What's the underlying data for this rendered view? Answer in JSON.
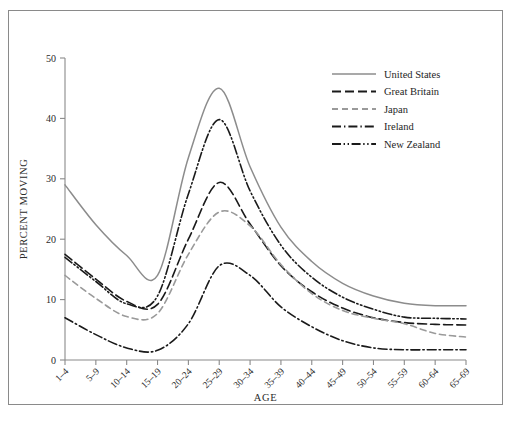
{
  "chart_data": {
    "type": "line",
    "title": "",
    "subtitle": "",
    "xlabel": "AGE",
    "ylabel": "PERCENT MOVING",
    "categories": [
      "1–4",
      "5–9",
      "10–14",
      "15–19",
      "20–24",
      "25–29",
      "30–34",
      "35–39",
      "40–44",
      "45–49",
      "50–54",
      "55–59",
      "60–64",
      "65–69"
    ],
    "xtick_labels": [
      "1–4",
      "5–9",
      "10–14",
      "15–19",
      "20–24",
      "25–29",
      "30–34",
      "35–39",
      "40–44",
      "45–49",
      "50–54",
      "55–59",
      "60–64",
      "65–69"
    ],
    "ytick_labels": [
      "0",
      "10",
      "20",
      "30",
      "40",
      "50"
    ],
    "ytick_values": [
      0,
      10,
      20,
      30,
      40,
      50
    ],
    "ylim": [
      0,
      50
    ],
    "grid": false,
    "legend_position": "top-right",
    "series": [
      {
        "name": "United States",
        "color": "#8c8c8c",
        "dash": "none",
        "values": [
          29.0,
          22.4,
          17.3,
          14.0,
          33.5,
          45.0,
          32.0,
          22.0,
          16.3,
          12.7,
          10.6,
          9.4,
          9.0,
          9.0
        ]
      },
      {
        "name": "Great Britain",
        "color": "#1a1a1a",
        "dash": "long-dash",
        "values": [
          17.5,
          13.4,
          9.7,
          9.2,
          20.0,
          29.4,
          22.5,
          15.6,
          11.3,
          8.6,
          7.0,
          6.2,
          5.9,
          5.8
        ]
      },
      {
        "name": "Japan",
        "color": "#9a9a9a",
        "dash": "dash",
        "values": [
          14.0,
          10.2,
          7.2,
          7.7,
          17.5,
          24.5,
          22.2,
          15.8,
          11.0,
          8.2,
          6.9,
          6.0,
          4.4,
          3.8
        ]
      },
      {
        "name": "Ireland",
        "color": "#1a1a1a",
        "dash": "dash-dot",
        "values": [
          7.0,
          4.2,
          2.0,
          1.6,
          6.0,
          15.6,
          14.0,
          8.8,
          5.5,
          3.2,
          2.0,
          1.7,
          1.7,
          1.7
        ]
      },
      {
        "name": "New Zealand",
        "color": "#1a1a1a",
        "dash": "dash-dot-dot",
        "values": [
          17.0,
          13.0,
          9.3,
          10.6,
          27.5,
          39.8,
          28.0,
          19.0,
          13.7,
          10.4,
          8.4,
          7.1,
          6.9,
          6.8
        ]
      }
    ]
  },
  "legend": {
    "items": [
      {
        "label": "United States"
      },
      {
        "label": "Great Britain"
      },
      {
        "label": "Japan"
      },
      {
        "label": "Ireland"
      },
      {
        "label": "New Zealand"
      }
    ]
  },
  "axes": {
    "y_title": "PERCENT MOVING",
    "x_title": "AGE"
  }
}
